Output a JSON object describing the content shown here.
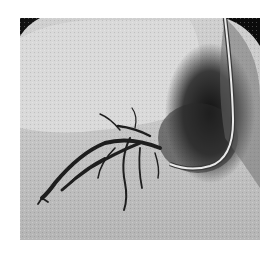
{
  "image": {
    "description": "Grayscale angiography image showing branching contrast-filled vessels and a curved catheter",
    "colors": {
      "background": "#ffffff",
      "tissue_light": "#d8d8d8",
      "tissue_mid": "#b9b9b9",
      "shadow_dark": "#1a1a1a",
      "vessel": "#202020",
      "catheter": "#e8e8e8"
    }
  }
}
